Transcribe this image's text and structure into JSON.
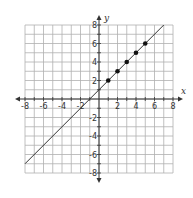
{
  "chart_data": {
    "type": "line",
    "title": "",
    "xlabel": "x",
    "ylabel": "y",
    "xlim": [
      -8,
      8
    ],
    "ylim": [
      -8,
      8
    ],
    "grid": true,
    "x_ticks": [
      -8,
      -6,
      -4,
      -2,
      2,
      4,
      6,
      8
    ],
    "y_ticks": [
      -8,
      -6,
      -4,
      -2,
      2,
      4,
      6,
      8
    ],
    "series": [
      {
        "name": "line",
        "type": "line",
        "equation": "y = x + 1",
        "x": [
          -8,
          7
        ],
        "y": [
          -7,
          8
        ]
      },
      {
        "name": "points",
        "type": "scatter",
        "x": [
          1,
          2,
          3,
          4,
          5
        ],
        "y": [
          2,
          3,
          4,
          5,
          6
        ]
      }
    ]
  },
  "colors": {
    "grid": "#b0b0b0",
    "axis": "#333333",
    "line": "#333333",
    "point": "#111111"
  }
}
